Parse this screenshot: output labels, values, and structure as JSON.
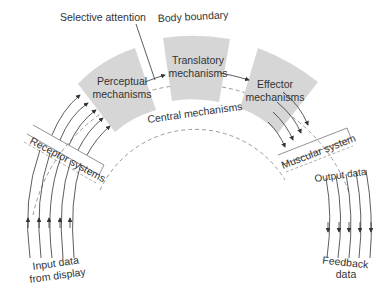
{
  "diagram": {
    "labels": {
      "selective_attention": "Selective attention",
      "body_boundary": "Body boundary",
      "central_mechanisms": "Central mechanisms",
      "perceptual_1": "Perceptual",
      "perceptual_2": "mechanisms",
      "translatory_1": "Translatory",
      "translatory_2": "mechanisms",
      "effector_1": "Effector",
      "effector_2": "mechanisms",
      "receptor_systems": "Receptor systems",
      "muscular_system": "Muscular system",
      "output_data": "Output data",
      "input_1": "Input data",
      "input_2": "from display",
      "feedback_1": "Feedback",
      "feedback_2": "data"
    },
    "colors": {
      "block_fill": "#d6d6d6",
      "line": "#333333",
      "dashed": "#9a9a9a"
    }
  }
}
